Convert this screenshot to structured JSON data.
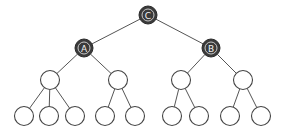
{
  "diagram": {
    "type": "tree",
    "colors": {
      "background": "#ffffff",
      "edge": "#555555",
      "highlighted_fill": "#3a3a3a",
      "highlighted_ring": "#d8d8d8",
      "label": "#f2f2f2",
      "plain_fill": "#ffffff",
      "plain_stroke": "#444444"
    },
    "nodes": [
      {
        "id": "C",
        "label": "C",
        "x": 148,
        "y": 15,
        "r": 9,
        "highlighted": true
      },
      {
        "id": "A",
        "label": "A",
        "x": 84,
        "y": 48,
        "r": 9,
        "highlighted": true
      },
      {
        "id": "B",
        "label": "B",
        "x": 211,
        "y": 48,
        "r": 9,
        "highlighted": true
      },
      {
        "id": "L2a",
        "label": "",
        "x": 50,
        "y": 80,
        "r": 9.5,
        "highlighted": false
      },
      {
        "id": "L2b",
        "label": "",
        "x": 118,
        "y": 80,
        "r": 9.5,
        "highlighted": false
      },
      {
        "id": "L2c",
        "label": "",
        "x": 181,
        "y": 80,
        "r": 9.5,
        "highlighted": false
      },
      {
        "id": "L2d",
        "label": "",
        "x": 243,
        "y": 80,
        "r": 9.5,
        "highlighted": false
      },
      {
        "id": "L3a",
        "label": "",
        "x": 24,
        "y": 116,
        "r": 9.5,
        "highlighted": false
      },
      {
        "id": "L3b",
        "label": "",
        "x": 49,
        "y": 116,
        "r": 9.5,
        "highlighted": false
      },
      {
        "id": "L3c",
        "label": "",
        "x": 75,
        "y": 116,
        "r": 9.5,
        "highlighted": false
      },
      {
        "id": "L3d",
        "label": "",
        "x": 105,
        "y": 116,
        "r": 9.5,
        "highlighted": false
      },
      {
        "id": "L3e",
        "label": "",
        "x": 135,
        "y": 116,
        "r": 9.5,
        "highlighted": false
      },
      {
        "id": "L3f",
        "label": "",
        "x": 172,
        "y": 116,
        "r": 9.5,
        "highlighted": false
      },
      {
        "id": "L3g",
        "label": "",
        "x": 199,
        "y": 116,
        "r": 9.5,
        "highlighted": false
      },
      {
        "id": "L3h",
        "label": "",
        "x": 230,
        "y": 116,
        "r": 9.5,
        "highlighted": false
      },
      {
        "id": "L3i",
        "label": "",
        "x": 261,
        "y": 116,
        "r": 9.5,
        "highlighted": false
      }
    ],
    "edges": [
      [
        "C",
        "A"
      ],
      [
        "C",
        "B"
      ],
      [
        "A",
        "L2a"
      ],
      [
        "A",
        "L2b"
      ],
      [
        "B",
        "L2c"
      ],
      [
        "B",
        "L2d"
      ],
      [
        "L2a",
        "L3a"
      ],
      [
        "L2a",
        "L3b"
      ],
      [
        "L2a",
        "L3c"
      ],
      [
        "L2b",
        "L3d"
      ],
      [
        "L2b",
        "L3e"
      ],
      [
        "L2c",
        "L3f"
      ],
      [
        "L2c",
        "L3g"
      ],
      [
        "L2d",
        "L3h"
      ],
      [
        "L2d",
        "L3i"
      ]
    ]
  }
}
